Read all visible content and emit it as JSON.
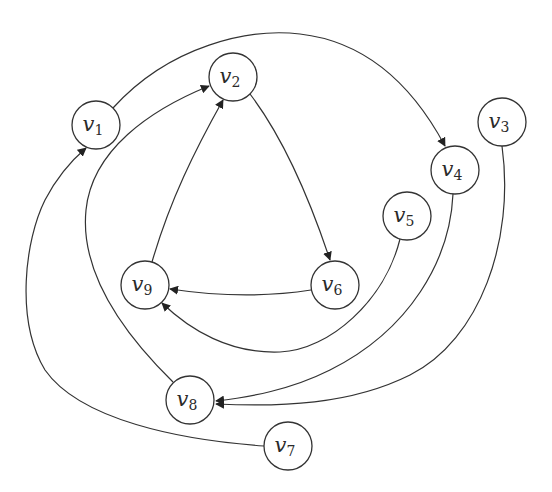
{
  "diagram": {
    "type": "directed-graph",
    "node_radius": 24,
    "stroke_color": "#333333",
    "background": "#ffffff",
    "nodes": [
      {
        "id": "v1",
        "base": "v",
        "sub": "1",
        "x": 96,
        "y": 125
      },
      {
        "id": "v2",
        "base": "v",
        "sub": "2",
        "x": 233,
        "y": 77
      },
      {
        "id": "v3",
        "base": "v",
        "sub": "3",
        "x": 502,
        "y": 122
      },
      {
        "id": "v4",
        "base": "v",
        "sub": "4",
        "x": 455,
        "y": 170
      },
      {
        "id": "v5",
        "base": "v",
        "sub": "5",
        "x": 407,
        "y": 216
      },
      {
        "id": "v6",
        "base": "v",
        "sub": "6",
        "x": 335,
        "y": 285
      },
      {
        "id": "v7",
        "base": "v",
        "sub": "7",
        "x": 288,
        "y": 446
      },
      {
        "id": "v8",
        "base": "v",
        "sub": "8",
        "x": 190,
        "y": 400
      },
      {
        "id": "v9",
        "base": "v",
        "sub": "9",
        "x": 145,
        "y": 285
      }
    ],
    "edges": [
      {
        "from": "v1",
        "to": "v4",
        "path": "M 113 108 C 170 45, 250 28, 300 34 C 370 42, 415 90, 445 146"
      },
      {
        "from": "v2",
        "to": "v6",
        "path": "M 250 94 C 285 140, 310 200, 330 260"
      },
      {
        "from": "v6",
        "to": "v9",
        "path": "M 311 290 C 260 298, 210 295, 170 289"
      },
      {
        "from": "v9",
        "to": "v2",
        "path": "M 152 262 C 170 200, 195 150, 223 100"
      },
      {
        "from": "v5",
        "to": "v9",
        "path": "M 400 239 C 385 300, 330 350, 280 352 C 230 354, 190 330, 162 303"
      },
      {
        "from": "v4",
        "to": "v8",
        "path": "M 453 194 C 450 260, 410 330, 330 370 C 290 390, 250 397, 216 401"
      },
      {
        "from": "v3",
        "to": "v8",
        "path": "M 502 146 C 515 240, 480 340, 410 375 C 350 405, 280 407, 216 404"
      },
      {
        "from": "v8",
        "to": "v2",
        "path": "M 173 382 C 120 330, 80 270, 86 210 C 92 150, 150 110, 209 86"
      },
      {
        "from": "v7",
        "to": "v1",
        "path": "M 264 446 C 180 440, 80 420, 45 370 C 15 320, 25 240, 45 200 C 58 175, 72 160, 86 148"
      }
    ]
  }
}
